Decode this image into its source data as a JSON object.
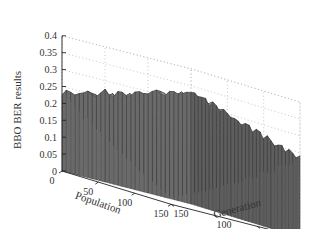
{
  "chart_data": {
    "type": "surface3d",
    "title": "",
    "xlabel": "Population",
    "ylabel": "Generation",
    "zlabel": "BBO BER results",
    "x_ticks": [
      "0",
      "50",
      "100",
      "150"
    ],
    "y_ticks": [
      "0",
      "50",
      "100",
      "150"
    ],
    "z_ticks": [
      "0",
      "0.05",
      "0.1",
      "0.15",
      "0.2",
      "0.25",
      "0.3",
      "0.35",
      "0.4"
    ],
    "xlim": [
      0,
      150
    ],
    "ylim": [
      0,
      150
    ],
    "zlim": [
      0,
      0.4
    ],
    "grid": true,
    "colormap": "gray",
    "corner_values": {
      "population_0_generation_0": 0.33,
      "population_0_generation_150": 0.23,
      "population_150_generation_0": 0.23,
      "population_150_generation_150": 0.02
    }
  }
}
